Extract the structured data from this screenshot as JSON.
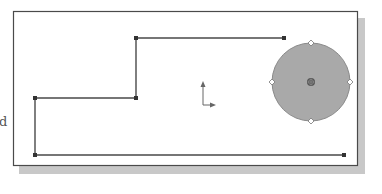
{
  "figure": {
    "side_label": "d",
    "canvas": {
      "x": 13,
      "y": 11,
      "width": 344,
      "height": 154,
      "border_color": "#4a4a4a",
      "background": "#ffffff",
      "shadow_color": "#c8c8c8"
    },
    "polyline": {
      "stroke": "#4a4a4a",
      "points": [
        [
          284,
          38
        ],
        [
          136,
          38
        ],
        [
          136,
          98
        ],
        [
          35,
          98
        ],
        [
          35,
          155
        ],
        [
          344,
          155
        ]
      ]
    },
    "circle": {
      "cx": 311,
      "cy": 82,
      "r": 39,
      "fill": "#a9a9a9",
      "stroke": "#8a8a8a",
      "handles": [
        "top",
        "right",
        "bottom",
        "left"
      ],
      "center_marker": "center-point-icon"
    },
    "axis_indicator": {
      "origin": [
        203,
        105
      ],
      "y_axis_end": [
        203,
        82
      ],
      "x_axis_end": [
        215,
        105
      ],
      "color": "#666666"
    }
  }
}
